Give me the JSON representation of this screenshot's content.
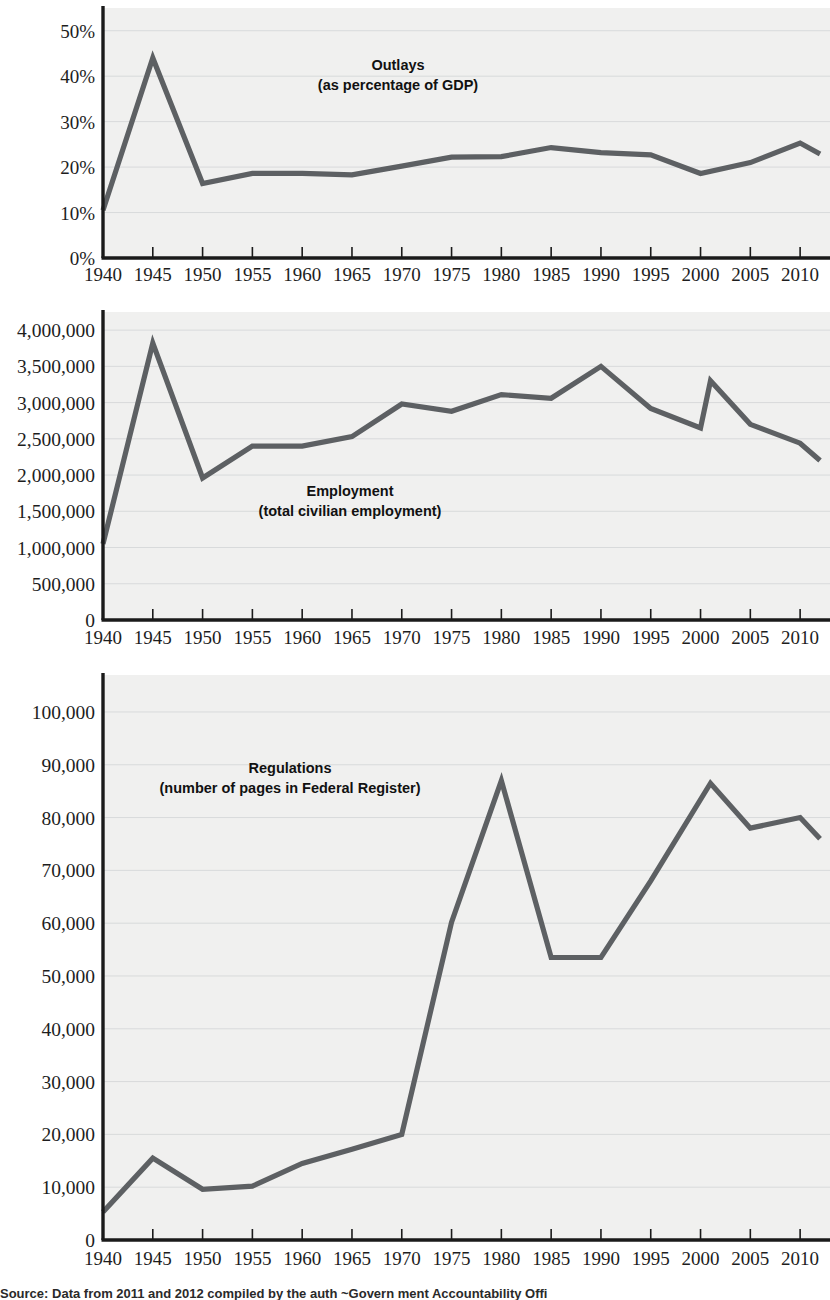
{
  "figure": {
    "background_color": "#ffffff",
    "plot_background_color": "#f0f0ef",
    "line_color": "#5d6063",
    "gridline_color": "#d8dadb",
    "axis_color": "#1a1a1a",
    "source_note": "Source: Data from 2011 and 2012 compiled by the auth      ~Govern  ment Accountability Offi"
  },
  "chart_data": [
    {
      "type": "line",
      "id": "outlays",
      "title": "Outlays",
      "subtitle": "(as percentage of GDP)",
      "xlabel": "",
      "ylabel": "",
      "grid": true,
      "legend": "none",
      "xlim": [
        1940,
        2013
      ],
      "ylim": [
        0,
        55
      ],
      "ytick_values": [
        0,
        10,
        20,
        30,
        40,
        50
      ],
      "ytick_labels": [
        "0%",
        "10%",
        "20%",
        "30%",
        "40%",
        "50%"
      ],
      "xtick_values": [
        1940,
        1945,
        1950,
        1955,
        1960,
        1965,
        1970,
        1975,
        1980,
        1985,
        1990,
        1995,
        2000,
        2005,
        2010
      ],
      "xtick_labels": [
        "1940",
        "1945",
        "1950",
        "1955",
        "1960",
        "1965",
        "1970",
        "1975",
        "1980",
        "1985",
        "1990",
        "1995",
        "2000",
        "2005",
        "2010"
      ],
      "x": [
        1940,
        1945,
        1950,
        1955,
        1960,
        1965,
        1970,
        1975,
        1980,
        1985,
        1990,
        1995,
        2000,
        2005,
        2010,
        2012
      ],
      "values": [
        10.5,
        44.0,
        16.4,
        18.6,
        18.6,
        18.3,
        20.2,
        22.2,
        22.3,
        24.3,
        23.2,
        22.7,
        18.6,
        21.0,
        25.3,
        22.9
      ]
    },
    {
      "type": "line",
      "id": "employment",
      "title": "Employment",
      "subtitle": "(total civilian employment)",
      "xlabel": "",
      "ylabel": "",
      "grid": true,
      "legend": "none",
      "xlim": [
        1940,
        2013
      ],
      "ylim": [
        0,
        4250000
      ],
      "ytick_values": [
        0,
        500000,
        1000000,
        1500000,
        2000000,
        2500000,
        3000000,
        3500000,
        4000000
      ],
      "ytick_labels": [
        "0",
        "500,000",
        "1,000,000",
        "1,500,000",
        "2,000,000",
        "2,500,000",
        "3,000,000",
        "3,500,000",
        "4,000,000"
      ],
      "xtick_values": [
        1940,
        1945,
        1950,
        1955,
        1960,
        1965,
        1970,
        1975,
        1980,
        1985,
        1990,
        1995,
        2000,
        2005,
        2010
      ],
      "xtick_labels": [
        "1940",
        "1945",
        "1950",
        "1955",
        "1960",
        "1965",
        "1970",
        "1975",
        "1980",
        "1985",
        "1990",
        "1995",
        "2000",
        "2005",
        "2010"
      ],
      "x": [
        1940,
        1945,
        1950,
        1955,
        1960,
        1965,
        1970,
        1975,
        1980,
        1985,
        1990,
        1995,
        2000,
        2001,
        2005,
        2010,
        2012
      ],
      "values": [
        1050000,
        3820000,
        1960000,
        2400000,
        2400000,
        2530000,
        2980000,
        2880000,
        3110000,
        3060000,
        3500000,
        2920000,
        2650000,
        3300000,
        2700000,
        2440000,
        2200000
      ]
    },
    {
      "type": "line",
      "id": "regulations",
      "title": "Regulations",
      "subtitle": "(number of pages in Federal Register)",
      "xlabel": "",
      "ylabel": "",
      "grid": true,
      "legend": "none",
      "xlim": [
        1940,
        2013
      ],
      "ylim": [
        0,
        107000
      ],
      "ytick_values": [
        0,
        10000,
        20000,
        30000,
        40000,
        50000,
        60000,
        70000,
        80000,
        90000,
        100000
      ],
      "ytick_labels": [
        "0",
        "10,000",
        "20,000",
        "30,000",
        "40,000",
        "50,000",
        "60,000",
        "70,000",
        "80,000",
        "90,000",
        "100,000"
      ],
      "xtick_values": [
        1940,
        1945,
        1950,
        1955,
        1960,
        1965,
        1970,
        1975,
        1980,
        1985,
        1990,
        1995,
        2000,
        2005,
        2010
      ],
      "xtick_labels": [
        "1940",
        "1945",
        "1950",
        "1955",
        "1960",
        "1965",
        "1970",
        "1975",
        "1980",
        "1985",
        "1990",
        "1995",
        "2000",
        "2005",
        "2010"
      ],
      "x": [
        1940,
        1945,
        1950,
        1955,
        1960,
        1965,
        1970,
        1975,
        1980,
        1985,
        1990,
        1995,
        2001,
        2005,
        2010,
        2012
      ],
      "values": [
        5300,
        15500,
        9600,
        10200,
        14500,
        17200,
        20000,
        60200,
        87000,
        53500,
        53500,
        68000,
        86500,
        78000,
        80000,
        76000
      ]
    }
  ]
}
